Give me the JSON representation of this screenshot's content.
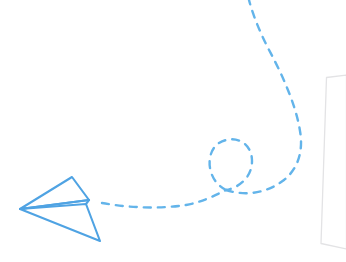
{
  "illustration": {
    "title": "Paper plane with dashed flight trail",
    "canvas": {
      "width": 346,
      "height": 262
    },
    "background_color": "#ffffff",
    "elements": [
      {
        "name": "paper-plane",
        "label": "Paper airplane",
        "stroke_color": "#4FA3E3",
        "fill_color": "none",
        "stroke_width": 2.1
      },
      {
        "name": "flight-trail",
        "label": "Dashed flight path with loop",
        "stroke_color": "#63B4EA",
        "stroke_width": 2.4,
        "dash_pattern": "7 7"
      },
      {
        "name": "document-card",
        "label": "Light grey document card",
        "stroke_color": "#E3E3E5",
        "fill_color": "#FFFFFF",
        "stroke_width": 1.3
      }
    ]
  },
  "colors": {
    "plane_blue": "#4FA3E3",
    "trail_blue": "#63B4EA",
    "card_border": "#E3E3E5",
    "background": "#ffffff"
  },
  "geometry": {
    "plane": {
      "nose": "20,209",
      "upper_wing_tip": "72,177",
      "lower_wing_tip": "100,241",
      "fold_right": "89,200"
    },
    "trail": {
      "start": "102,203",
      "loop_top": "231,143",
      "loop_cross": "226,190",
      "exit_top": "248,0",
      "bulge_right": "301,131"
    },
    "card": {
      "top_left": "326,77",
      "bottom_left": "321,243"
    }
  }
}
